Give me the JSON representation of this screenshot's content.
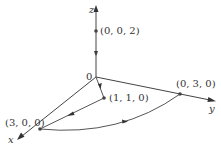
{
  "diagram": {
    "type": "3d-coordinate-path",
    "axes": {
      "x": {
        "label": "x"
      },
      "y": {
        "label": "y"
      },
      "z": {
        "label": "z"
      }
    },
    "origin": {
      "label": "0"
    },
    "points": [
      {
        "id": "p002",
        "label": "(0, 0, 2)"
      },
      {
        "id": "p030",
        "label": "(0, 3, 0)"
      },
      {
        "id": "p300",
        "label": "(3, 0, 0)"
      },
      {
        "id": "p110",
        "label": "(1, 1, 0)"
      }
    ],
    "paths": [
      {
        "from": "(0, 0, 2)",
        "to": "0",
        "kind": "segment",
        "direction": "downward along z-axis"
      },
      {
        "from": "0",
        "to": "(1, 1, 0)",
        "kind": "segment"
      },
      {
        "from": "(1, 1, 0)",
        "to": "(3, 0, 0)",
        "kind": "segment"
      },
      {
        "from": "(3, 0, 0)",
        "to": "(0, 3, 0)",
        "kind": "arc"
      }
    ],
    "colors": {
      "stroke": "#444444",
      "text": "#333333",
      "background": "#ffffff"
    }
  }
}
